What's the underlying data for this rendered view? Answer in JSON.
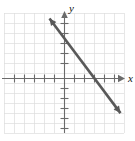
{
  "figure": {
    "title": "",
    "background_color": "#ffffff"
  },
  "chart_data": {
    "type": "line",
    "title": "",
    "xlabel": "x",
    "ylabel": "y",
    "grid": true,
    "grid_color": "#dcdcdc",
    "grid_step": 1,
    "axis_color": "#6b6b6b",
    "line_color": "#595959",
    "xlim": [
      -6,
      6
    ],
    "ylim": [
      -6,
      6
    ],
    "x_tick_labels": [],
    "y_tick_labels": [],
    "legend": null,
    "series": [
      {
        "name": "line",
        "kind": "line",
        "slope": -1.3333,
        "intercept": 4,
        "equation": "y = -4/3 x + 4",
        "x_intercept": 3,
        "y_intercept": 4,
        "arrow_start": true,
        "arrow_end": true,
        "x": [
          -1.5,
          5.6
        ],
        "y": [
          6,
          -3.46
        ],
        "color": "#595959"
      }
    ],
    "annotations": []
  },
  "axes": {
    "x_axis_label": "x",
    "y_axis_label": "y",
    "x_arrow": "arrow-right",
    "y_arrow": "arrow-up"
  }
}
